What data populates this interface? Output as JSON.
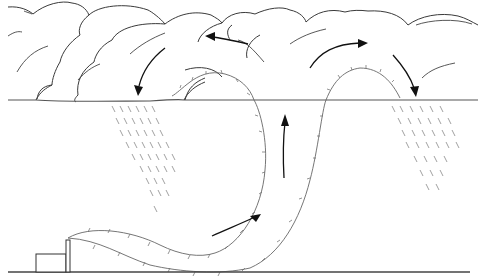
{
  "diagram": {
    "title": "",
    "description": "Line illustration of a smokestack plume rising into a cumulus cloud, with circulation arrows and rain falling from cloud base",
    "labels": [],
    "elements": {
      "cloud": "cumulus cloud mass",
      "cloud_base": "cloud base line",
      "plume": "smoke plume from stack",
      "stack": "smokestack",
      "building": "factory building",
      "ground": "ground line",
      "rain_left": "rain shaft (left)",
      "rain_right": "rain shaft (right)",
      "arrows": [
        "updraft arrow (lower)",
        "updraft arrow (middle)",
        "outflow arrow (upper left)",
        "outflow arrow (upper right)",
        "downdraft arrow (left)",
        "downdraft arrow (right)"
      ]
    },
    "colors": {
      "line": "#333333",
      "background": "#ffffff",
      "rain": "#888888"
    }
  }
}
